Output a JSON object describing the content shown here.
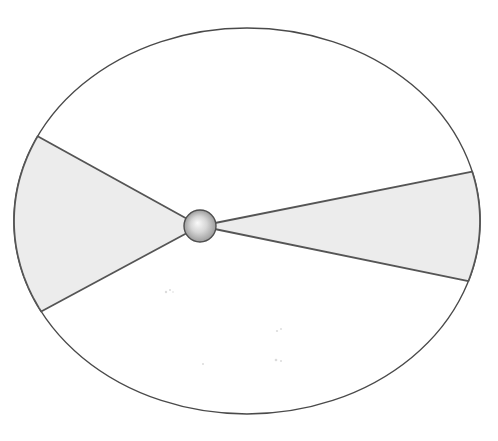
{
  "figure": {
    "width": 498,
    "height": 441,
    "background": "#ffffff"
  },
  "diagram": {
    "type": "elliptical-orbit-with-swept-sectors",
    "ellipse": {
      "cx": 247,
      "cy": 221,
      "rx": 233,
      "ry": 193,
      "fill": "#ffffff",
      "stroke": "#4a4a4a",
      "stroke_width": 1.4
    },
    "sectors": {
      "fill": "#ececec",
      "stroke": "#555555",
      "stroke_width": 1.8,
      "items": [
        {
          "name": "left-sector",
          "p1": [
            42,
            138
          ],
          "p2": [
            40,
            312
          ]
        },
        {
          "name": "right-sector",
          "p1": [
            470,
            172
          ],
          "p2": [
            464,
            280
          ]
        }
      ]
    },
    "body": {
      "cx": 200,
      "cy": 226,
      "r": 16,
      "outline": "#4f4f4f",
      "outline_width": 1.4,
      "gradient": {
        "highlight": "#fafafa",
        "mid": "#d6d6d6",
        "edge": "#9c9c9c",
        "fx": 0.42,
        "fy": 0.4
      }
    },
    "speckles": {
      "color": "#bdbdbd",
      "opacity": 0.55,
      "items": [
        [
          166,
          292,
          1.2
        ],
        [
          170,
          290,
          1.0
        ],
        [
          173,
          292,
          0.8
        ],
        [
          277,
          331,
          1.1
        ],
        [
          281,
          329,
          0.9
        ],
        [
          276,
          360,
          1.3
        ],
        [
          281,
          361,
          1.0
        ],
        [
          203,
          364,
          1.0
        ]
      ]
    }
  }
}
